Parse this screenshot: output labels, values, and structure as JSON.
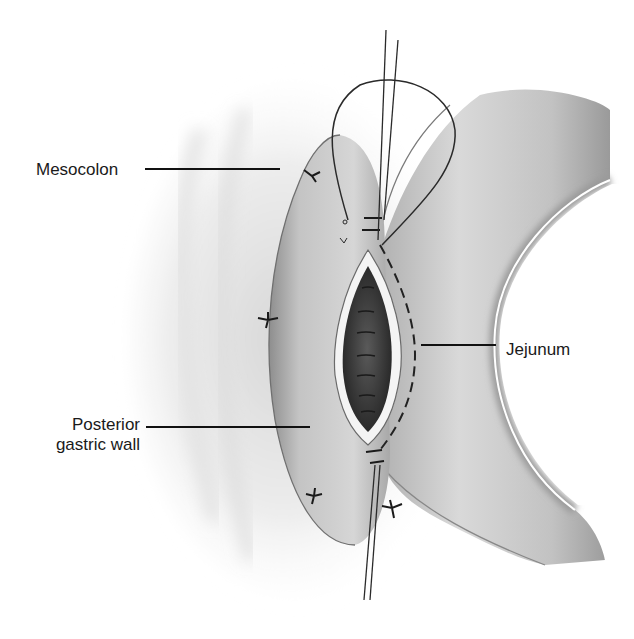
{
  "figure": {
    "type": "surgical anatomical illustration",
    "colors": {
      "background": "#ffffff",
      "tissue_light": "#e6e6e6",
      "tissue_mid": "#bdbdbd",
      "tissue_dark": "#8a8a8a",
      "lumen": "#3a3a3a",
      "suture": "#2a2a2a",
      "label_text": "#1a1a1a"
    }
  },
  "labels": {
    "mesocolon": "Mesocolon",
    "jejunum": "Jejunum",
    "posterior_gastric_wall_line1": "Posterior",
    "posterior_gastric_wall_line2": "gastric wall"
  }
}
